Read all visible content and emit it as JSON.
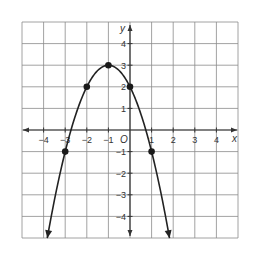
{
  "chart_data": {
    "type": "line",
    "title": "",
    "xlabel": "x",
    "ylabel": "y",
    "origin_label": "O",
    "xlim": [
      -5,
      5
    ],
    "ylim": [
      -5,
      5
    ],
    "grid": true,
    "x_ticks": [
      -4,
      -3,
      -2,
      -1,
      1,
      2,
      3,
      4
    ],
    "y_ticks": [
      4,
      3,
      2,
      1,
      -1,
      -2,
      -3,
      -4
    ],
    "x_tick_labels": [
      "−4",
      "−3",
      "−2",
      "−1",
      "1",
      "2",
      "3",
      "4"
    ],
    "y_tick_labels": [
      "4",
      "3",
      "2",
      "1",
      "−1",
      "−2",
      "−3",
      "−4"
    ],
    "function": "y = -(x + 1)^2 + 3",
    "curve_x_range": [
      -3.83,
      1.83
    ],
    "series": [
      {
        "name": "parabola points",
        "points": [
          {
            "x": -3,
            "y": -1
          },
          {
            "x": -2,
            "y": 2
          },
          {
            "x": -1,
            "y": 3
          },
          {
            "x": 0,
            "y": 2
          },
          {
            "x": 1,
            "y": -1
          }
        ]
      }
    ],
    "colors": {
      "grid": "#8a8a8a",
      "axis": "#333333",
      "curve": "#222222",
      "points": "#1a1a1a"
    }
  }
}
